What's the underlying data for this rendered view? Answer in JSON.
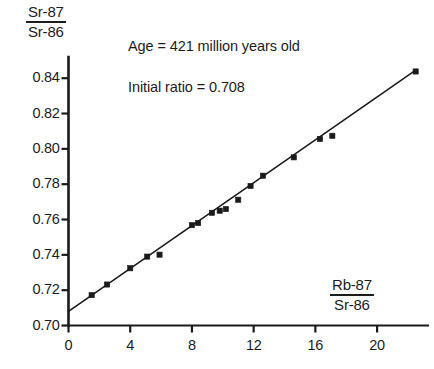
{
  "chart_data": {
    "type": "scatter",
    "title": "",
    "subtitle": "",
    "xlabel": "Rb-87 / Sr-86",
    "ylabel": "Sr-87 / Sr-86",
    "xlabel_numerator": "Rb-87",
    "xlabel_denominator": "Sr-86",
    "ylabel_numerator": "Sr-87",
    "ylabel_denominator": "Sr-86",
    "xlim": [
      0,
      23.3
    ],
    "ylim": [
      0.7,
      0.852
    ],
    "xticks": [
      0,
      4,
      8,
      12,
      16,
      20
    ],
    "xtick_labels": [
      "0",
      "4",
      "8",
      "12",
      "16",
      "20"
    ],
    "yticks": [
      0.7,
      0.72,
      0.74,
      0.76,
      0.78,
      0.8,
      0.82,
      0.84
    ],
    "ytick_labels": [
      "0.70",
      "0.72",
      "0.74",
      "0.76",
      "0.78",
      "0.80",
      "0.82",
      "0.84"
    ],
    "grid": false,
    "legend": false,
    "annotations": [
      "Age = 421 million years old",
      "Initial ratio = 0.708"
    ],
    "fit_line": {
      "intercept": 0.708,
      "slope": 0.00607,
      "x_start": 0.0,
      "x_end": 22.6
    },
    "series": [
      {
        "name": "Whole-rock samples",
        "marker": "filled-square",
        "color": "#1a1a1a",
        "points": [
          {
            "x": 1.5,
            "y": 0.7172
          },
          {
            "x": 2.5,
            "y": 0.7232
          },
          {
            "x": 4.0,
            "y": 0.7324
          },
          {
            "x": 5.1,
            "y": 0.739
          },
          {
            "x": 5.9,
            "y": 0.7401
          },
          {
            "x": 8.0,
            "y": 0.7568
          },
          {
            "x": 8.4,
            "y": 0.758
          },
          {
            "x": 9.3,
            "y": 0.7638
          },
          {
            "x": 9.8,
            "y": 0.765
          },
          {
            "x": 10.2,
            "y": 0.7659
          },
          {
            "x": 11.0,
            "y": 0.7712
          },
          {
            "x": 11.8,
            "y": 0.779
          },
          {
            "x": 12.6,
            "y": 0.7848
          },
          {
            "x": 14.6,
            "y": 0.7952
          },
          {
            "x": 16.3,
            "y": 0.8056
          },
          {
            "x": 17.1,
            "y": 0.8074
          },
          {
            "x": 22.5,
            "y": 0.8438
          }
        ]
      }
    ]
  }
}
